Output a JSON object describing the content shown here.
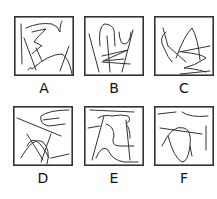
{
  "options": [
    {
      "label": "A"
    },
    {
      "label": "B"
    },
    {
      "label": "C"
    },
    {
      "label": "D"
    },
    {
      "label": "E"
    },
    {
      "label": "F"
    }
  ]
}
